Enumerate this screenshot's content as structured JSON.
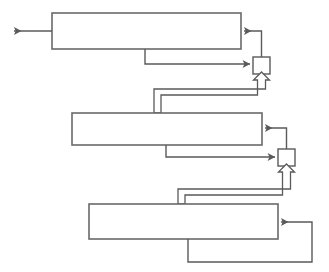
{
  "diagram": {
    "type": "block-diagram",
    "canvas": {
      "width": 329,
      "height": 272,
      "background": "#ffffff"
    },
    "style": {
      "stroke": "#5a5a5a",
      "stroke_light": "#6e6e6e",
      "fill": "#ffffff",
      "line_width": 1.4,
      "block_line_width": 1.6
    },
    "blocks": [
      {
        "name": "stage-1-block",
        "label": "",
        "x": 52,
        "y": 13,
        "width": 189,
        "height": 36
      },
      {
        "name": "stage-2-block",
        "label": "",
        "x": 72,
        "y": 113,
        "width": 190,
        "height": 32
      },
      {
        "name": "stage-3-block",
        "label": "",
        "x": 89,
        "y": 204,
        "width": 189,
        "height": 35
      }
    ],
    "junctions": [
      {
        "name": "junction-1",
        "label": "",
        "x": 253,
        "y": 57,
        "width": 17,
        "height": 17
      },
      {
        "name": "junction-2",
        "label": "",
        "x": 278,
        "y": 149,
        "width": 17,
        "height": 17
      }
    ],
    "connectors": [
      {
        "name": "output-arrow-left",
        "from": "stage-1-block",
        "to": "external-output",
        "direction": "left",
        "arrow": "solid"
      },
      {
        "name": "junction-1-to-stage-1",
        "from": "junction-1",
        "to": "stage-1-block",
        "direction": "left",
        "arrow": "solid"
      },
      {
        "name": "stage-1-feedback-to-junction-1",
        "from": "stage-1-block",
        "to": "junction-1",
        "direction": "right",
        "arrow": "solid"
      },
      {
        "name": "stage-2-bus-to-junction-1",
        "from": "stage-2-block",
        "to": "junction-1",
        "direction": "up",
        "arrow": "hollow"
      },
      {
        "name": "junction-2-to-stage-2",
        "from": "junction-2",
        "to": "stage-2-block",
        "direction": "left",
        "arrow": "solid"
      },
      {
        "name": "stage-2-feedback-to-junction-2",
        "from": "stage-2-block",
        "to": "junction-2",
        "direction": "right",
        "arrow": "solid"
      },
      {
        "name": "stage-3-bus-to-junction-2",
        "from": "stage-3-block",
        "to": "junction-2",
        "direction": "up",
        "arrow": "hollow"
      },
      {
        "name": "stage-3-self-feedback",
        "from": "stage-3-block",
        "to": "stage-3-block",
        "direction": "right",
        "arrow": "solid"
      }
    ]
  }
}
